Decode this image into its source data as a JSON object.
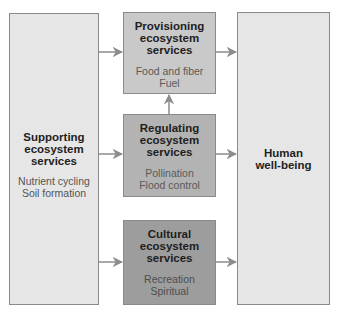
{
  "diagram": {
    "nodes": {
      "supporting": {
        "title": [
          "Supporting",
          "ecosystem",
          "services"
        ],
        "examples": [
          "Nutrient cycling",
          "Soil formation"
        ]
      },
      "provisioning": {
        "title": [
          "Provisioning",
          "ecosystem",
          "services"
        ],
        "examples": [
          "Food and fiber",
          "Fuel"
        ]
      },
      "regulating": {
        "title": [
          "Regulating",
          "ecosystem",
          "services"
        ],
        "examples": [
          "Pollination",
          "Flood control"
        ]
      },
      "cultural": {
        "title": [
          "Cultural",
          "ecosystem",
          "services"
        ],
        "examples": [
          "Recreation",
          "Spiritual"
        ]
      },
      "wellbeing": {
        "title": [
          "Human",
          "well-being"
        ]
      }
    },
    "edges": [
      {
        "from": "supporting",
        "to": "provisioning"
      },
      {
        "from": "supporting",
        "to": "regulating"
      },
      {
        "from": "supporting",
        "to": "cultural"
      },
      {
        "from": "regulating",
        "to": "provisioning"
      },
      {
        "from": "provisioning",
        "to": "wellbeing"
      },
      {
        "from": "regulating",
        "to": "wellbeing"
      },
      {
        "from": "cultural",
        "to": "wellbeing"
      }
    ],
    "colors": {
      "light_box": "#e6e6e6",
      "provisioning": "#c9c9c9",
      "regulating": "#b3b3b3",
      "cultural": "#9d9d9d",
      "arrow": "#8c8c8c"
    }
  }
}
